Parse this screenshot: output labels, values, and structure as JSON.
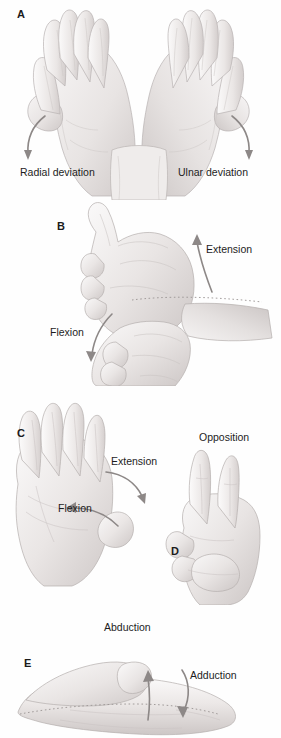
{
  "figure": {
    "background_color": "#fefefe",
    "ink_color": "#1d1d1d",
    "skin_shade_light": "#f4f2f1",
    "skin_shade_mid": "#e2dedd",
    "skin_shade_dark": "#c9c4c3",
    "outline_color": "#b9b3b2",
    "arrow_color": "#8f8a89"
  },
  "panels": [
    {
      "letter": "A",
      "name": "wrist-deviation",
      "annotations": [
        {
          "label": "Radial deviation",
          "arrow": "curve-down-left"
        },
        {
          "label": "Ulnar deviation",
          "arrow": "curve-down-right"
        }
      ]
    },
    {
      "letter": "B",
      "name": "wrist-flexion-extension",
      "annotations": [
        {
          "label": "Extension",
          "arrow": "curve-up"
        },
        {
          "label": "Flexion",
          "arrow": "curve-down"
        }
      ]
    },
    {
      "letter": "C",
      "name": "thumb-flexion-extension",
      "annotations": [
        {
          "label": "Extension",
          "arrow": "curve-right-down"
        },
        {
          "label": "Flexion",
          "arrow": "curve-left"
        }
      ]
    },
    {
      "letter": "D",
      "name": "thumb-opposition",
      "annotations": [
        {
          "label": "Opposition",
          "arrow": "none"
        }
      ]
    },
    {
      "letter": "E",
      "name": "thumb-abduction-adduction",
      "annotations": [
        {
          "label": "Abduction",
          "arrow": "straight-up"
        },
        {
          "label": "Adduction",
          "arrow": "curve-down"
        }
      ]
    }
  ],
  "labels": {
    "a_letter": "A",
    "a_radial": "Radial deviation",
    "a_ulnar": "Ulnar deviation",
    "b_letter": "B",
    "b_extension": "Extension",
    "b_flexion": "Flexion",
    "c_letter": "C",
    "c_extension": "Extension",
    "c_flexion": "Flexion",
    "d_letter": "D",
    "d_opposition": "Opposition",
    "e_letter": "E",
    "e_abduction": "Abduction",
    "e_adduction": "Adduction"
  }
}
